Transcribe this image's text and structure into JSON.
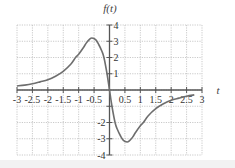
{
  "chart_data": {
    "type": "line",
    "title": "f(t)",
    "xlabel": "t",
    "ylabel": "f(t)",
    "xlim": [
      -3,
      3
    ],
    "ylim": [
      -4,
      4
    ],
    "grid": true,
    "x_ticks": [
      -3,
      -2.5,
      -2,
      -1.5,
      -1,
      -0.5,
      0.5,
      1,
      1.5,
      2,
      2.5,
      3
    ],
    "x_tick_labels": [
      "-3",
      "-2.5",
      "-2",
      "-1.5",
      "-1",
      "-0.5",
      "0.5",
      "1",
      "1.5",
      "2",
      "2.5",
      "3"
    ],
    "y_ticks_pos": [
      1,
      2,
      3,
      4
    ],
    "y_tick_labels_pos": [
      "1",
      "2",
      "3",
      "4"
    ],
    "y_ticks_neg": [
      -2,
      -3,
      -4
    ],
    "y_tick_labels_neg": [
      "-2",
      "-3",
      "-4"
    ],
    "series": [
      {
        "name": "f(t)",
        "color": "#6e6e6e",
        "x": [
          -3,
          -2.75,
          -2.5,
          -2.25,
          -2,
          -1.75,
          -1.5,
          -1.25,
          -1.1,
          -1,
          -0.85,
          -0.75,
          -0.65,
          -0.57,
          -0.45,
          -0.35,
          -0.25,
          -0.18,
          -0.08,
          0,
          0.08,
          0.18,
          0.25,
          0.35,
          0.45,
          0.57,
          0.65,
          0.75,
          0.85,
          1,
          1.1,
          1.25,
          1.5,
          1.75,
          2,
          2.25,
          2.5,
          2.75
        ],
        "y": [
          0.25,
          0.3,
          0.38,
          0.5,
          0.63,
          0.85,
          1.15,
          1.6,
          2.0,
          2.2,
          2.6,
          2.9,
          3.12,
          3.2,
          3.1,
          2.8,
          2.4,
          2.0,
          1.0,
          0,
          -1.0,
          -2.0,
          -2.4,
          -2.8,
          -3.1,
          -3.2,
          -3.12,
          -2.9,
          -2.6,
          -2.2,
          -2.0,
          -1.6,
          -1.15,
          -0.85,
          -0.63,
          -0.5,
          -0.38,
          -0.3
        ]
      }
    ]
  },
  "colors": {
    "axis": "#555555",
    "grid": "#bdbdbd",
    "curve": "#6e6e6e",
    "footer": "#f2f2f2"
  }
}
